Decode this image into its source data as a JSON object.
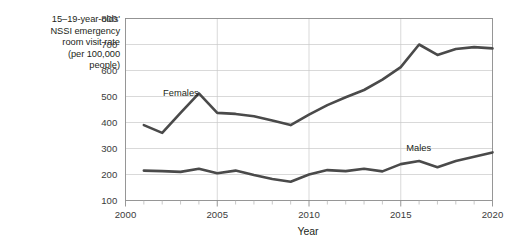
{
  "chart_data": {
    "type": "line",
    "title": "",
    "xlabel": "Year",
    "ylabel": "15–19-year-olds' NSSI emergency room visit rate (per 100,000 people)",
    "ylabel_lines": [
      "15–19-year-olds'",
      "NSSI emergency",
      "room visit rate",
      "(per 100,000",
      "people)"
    ],
    "x": [
      2001,
      2002,
      2003,
      2004,
      2005,
      2006,
      2007,
      2008,
      2009,
      2010,
      2011,
      2012,
      2013,
      2014,
      2015,
      2016,
      2017,
      2018,
      2019,
      2020
    ],
    "xlim": [
      2000,
      2020
    ],
    "ylim": [
      100,
      800
    ],
    "xticks": [
      2000,
      2005,
      2010,
      2015,
      2020
    ],
    "xtick_labels": [
      "2000",
      "2005",
      "2010",
      "2015",
      "2020"
    ],
    "xminor_ticks": [
      2001,
      2002,
      2003,
      2004,
      2006,
      2007,
      2008,
      2009,
      2011,
      2012,
      2013,
      2014,
      2016,
      2017,
      2018,
      2019
    ],
    "yticks": [
      100,
      200,
      300,
      400,
      500,
      600,
      700,
      800
    ],
    "ytick_labels": [
      "100",
      "200",
      "300",
      "400",
      "500",
      "600",
      "700",
      "800"
    ],
    "grid": "horizontal-and-vertical-major",
    "legend_position": "inline-labels",
    "series": [
      {
        "name": "Females",
        "color": "#4a4a4a",
        "label_x": 2002.05,
        "label_y": 508,
        "values": [
          390,
          360,
          437,
          512,
          437,
          433,
          424,
          408,
          390,
          430,
          467,
          497,
          525,
          565,
          613,
          700,
          660,
          683,
          690,
          685
        ]
      },
      {
        "name": "Males",
        "color": "#4a4a4a",
        "label_x": 2015.3,
        "label_y": 300,
        "values": [
          215,
          213,
          210,
          222,
          205,
          215,
          198,
          183,
          172,
          200,
          217,
          213,
          222,
          212,
          240,
          252,
          228,
          252,
          268,
          285
        ]
      }
    ]
  }
}
